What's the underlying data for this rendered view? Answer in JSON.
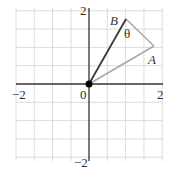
{
  "diagram": {
    "type": "coordinate-plane",
    "axes": {
      "x_range": [
        -2,
        2
      ],
      "y_range": [
        -2,
        2
      ],
      "tick_labels": {
        "x_min": "−2",
        "x_max": "2",
        "y_min": "−2",
        "y_max": "2",
        "origin": "0"
      }
    },
    "grid": {
      "spacing": 0.5,
      "color": "#d9d9d9"
    },
    "points": {
      "origin": {
        "label": "0",
        "x": 0,
        "y": 0
      },
      "A": {
        "label": "A",
        "x": 1.75,
        "y": 1.0,
        "color": "#a8a8a8"
      },
      "B": {
        "label": "B",
        "x": 1.0,
        "y": 1.75,
        "color": "#3a3a3a"
      }
    },
    "angle_label": "θ",
    "colors": {
      "axis": "#333333",
      "vector_B": "#3a3a3a",
      "vector_A": "#a8a8a8",
      "segment_AB": "#a8a8a8",
      "origin_dot": "#000000"
    }
  }
}
